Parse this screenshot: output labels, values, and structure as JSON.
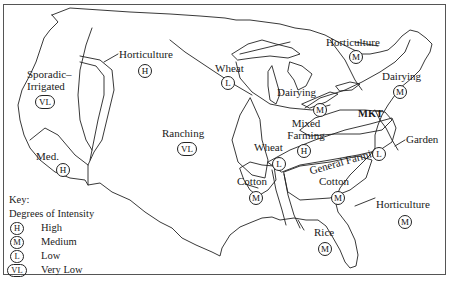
{
  "map": {
    "title": "Agricultural regions of the United States",
    "regions": [
      {
        "name": "Horticulture",
        "intensity": "H",
        "area": "Pacific Northwest interior"
      },
      {
        "name": "Sporadic-Irrigated",
        "intensity": "VL",
        "area": "Far West"
      },
      {
        "name": "Med.",
        "intensity": "H",
        "area": "California"
      },
      {
        "name": "Ranching",
        "intensity": "VL",
        "area": "Great Plains / Mountain West"
      },
      {
        "name": "Wheat",
        "intensity": "L",
        "area": "Northern Plains"
      },
      {
        "name": "Horticulture",
        "intensity": "M",
        "area": "Great Lakes north"
      },
      {
        "name": "Dairying",
        "intensity": "M",
        "area": "Upper Midwest"
      },
      {
        "name": "Dairying",
        "intensity": "M",
        "area": "Northeast"
      },
      {
        "name": "Mixed Farming",
        "intensity": "H",
        "area": "Corn Belt"
      },
      {
        "name": "MKT",
        "intensity": "",
        "area": "Mid-Atlantic"
      },
      {
        "name": "Wheat",
        "intensity": "L",
        "area": "Southern Plains"
      },
      {
        "name": "Garden",
        "intensity": "",
        "area": "Atlantic coast"
      },
      {
        "name": "General Farming",
        "intensity": "L",
        "area": "Upper South"
      },
      {
        "name": "Cotton",
        "intensity": "M",
        "area": "Texas/Oklahoma"
      },
      {
        "name": "Cotton",
        "intensity": "M",
        "area": "Deep South"
      },
      {
        "name": "Rice",
        "intensity": "M",
        "area": "Mississippi Delta"
      },
      {
        "name": "Horticulture",
        "intensity": "M",
        "area": "Florida"
      }
    ]
  },
  "labels": {
    "horticulture_nw": "Horticulture",
    "horticulture_nw_badge": "H",
    "sporadic_1": "Sporadic–",
    "sporadic_2": "Irrigated",
    "sporadic_badge": "VL",
    "med": "Med.",
    "med_badge": "H",
    "ranching": "Ranching",
    "ranching_badge": "VL",
    "wheat_n": "Wheat",
    "wheat_n_badge": "L",
    "horticulture_ne": "Horticulture",
    "horticulture_ne_badge": "M",
    "dairying_mw": "Dairying",
    "dairying_mw_badge": "M",
    "dairying_ne": "Dairying",
    "dairying_ne_badge": "M",
    "mixed_1": "Mixed",
    "mixed_2": "Farming",
    "mixed_badge": "H",
    "mkt": "MKT",
    "wheat_s": "Wheat",
    "wheat_s_badge": "L",
    "garden": "Garden",
    "general_farming": "General Farming",
    "general_badge": "L",
    "cotton_w": "Cotton",
    "cotton_w_badge": "M",
    "cotton_e": "Cotton",
    "cotton_e_badge": "M",
    "rice": "Rice",
    "rice_badge": "M",
    "horticulture_fl": "Horticulture",
    "horticulture_fl_badge": "M"
  },
  "key": {
    "title": "Key:",
    "subtitle": "Degrees of Intensity",
    "items": [
      {
        "code": "H",
        "label": "High"
      },
      {
        "code": "M",
        "label": "Medium"
      },
      {
        "code": "L",
        "label": "Low"
      },
      {
        "code": "VL",
        "label": "Very Low"
      }
    ]
  },
  "colors": {
    "line": "#222222",
    "background": "#ffffff"
  }
}
